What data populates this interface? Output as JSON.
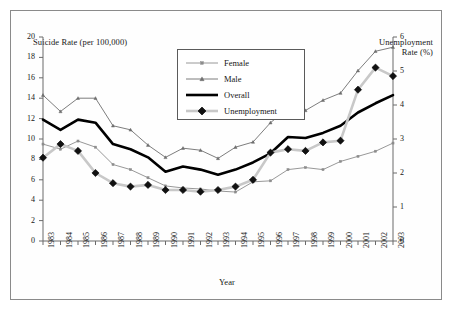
{
  "figure": {
    "left_axis_title": "Suicide Rate (per 100,000)",
    "right_axis_title_line1": "Unemployment",
    "right_axis_title_line2": "Rate (%)",
    "x_axis_title": "Year"
  },
  "legend": {
    "items": [
      {
        "label": "Female",
        "icon": "square-marker-line",
        "color": "#8c8c8c"
      },
      {
        "label": "Male",
        "icon": "triangle-marker-line",
        "color": "#6e6e6e"
      },
      {
        "label": "Overall",
        "icon": "thick-solid-line",
        "color": "#000000"
      },
      {
        "label": "Unemployment",
        "icon": "diamond-marker-line",
        "color": "#c8c8c8"
      }
    ]
  },
  "chart_data": {
    "type": "line",
    "title": "",
    "xlabel": "Year",
    "ylabel": "Suicide Rate (per 100,000)",
    "y2label": "Unemployment Rate (%)",
    "ylim": [
      0,
      20
    ],
    "y2lim": [
      0,
      6
    ],
    "yticks": [
      0,
      2,
      4,
      6,
      8,
      10,
      12,
      14,
      16,
      18,
      20
    ],
    "y2ticks": [
      0,
      1,
      2,
      3,
      4,
      5,
      6
    ],
    "grid": false,
    "legend_position": "top-center",
    "categories": [
      "1983",
      "1984",
      "1985",
      "1986",
      "1987",
      "1988",
      "1989",
      "1990",
      "1991",
      "1992",
      "1993",
      "1994",
      "1995",
      "1996",
      "1997",
      "1998",
      "1999",
      "2000",
      "2001",
      "2002",
      "2003"
    ],
    "series": [
      {
        "name": "Female",
        "axis": "left",
        "marker": "square",
        "color": "#8c8c8c",
        "values": [
          9.5,
          9.0,
          9.8,
          9.2,
          7.5,
          7.0,
          6.2,
          5.4,
          5.2,
          5.1,
          4.9,
          4.8,
          5.8,
          5.9,
          7.0,
          7.2,
          7.0,
          7.8,
          8.3,
          8.8,
          9.6
        ]
      },
      {
        "name": "Male",
        "axis": "left",
        "marker": "triangle",
        "color": "#6e6e6e",
        "values": [
          14.3,
          12.7,
          14.0,
          14.0,
          11.3,
          10.9,
          9.4,
          8.2,
          9.1,
          8.9,
          8.1,
          9.2,
          9.7,
          11.6,
          13.0,
          12.8,
          13.8,
          14.5,
          16.7,
          18.6,
          19.0
        ]
      },
      {
        "name": "Overall",
        "axis": "left",
        "marker": "none",
        "color": "#000000",
        "values": [
          11.9,
          10.9,
          11.9,
          11.6,
          9.5,
          9.0,
          8.2,
          6.8,
          7.3,
          7.0,
          6.5,
          7.0,
          7.7,
          8.6,
          10.2,
          10.1,
          10.6,
          11.3,
          12.6,
          13.5,
          14.3
        ]
      },
      {
        "name": "Unemployment",
        "axis": "right",
        "marker": "diamond",
        "color": "#c8c8c8",
        "values": [
          2.45,
          2.85,
          2.65,
          2.0,
          1.7,
          1.6,
          1.65,
          1.5,
          1.5,
          1.45,
          1.5,
          1.6,
          1.8,
          2.6,
          2.7,
          2.65,
          2.9,
          2.95,
          4.45,
          5.1,
          4.85
        ]
      }
    ],
    "unemployment_values_on_left_scale": [
      8.2,
      9.5,
      8.85,
      6.65,
      5.7,
      5.4,
      5.6,
      5.1,
      5.1,
      4.95,
      5.35,
      6.1,
      8.7,
      9.1,
      8.95,
      9.75,
      9.95,
      14.95,
      16.9,
      16.2
    ]
  }
}
